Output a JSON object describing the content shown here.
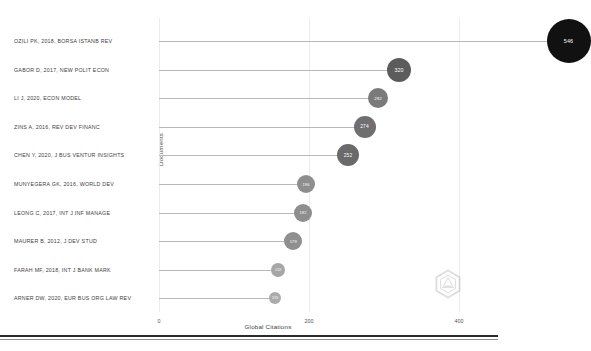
{
  "chart_data": {
    "type": "bar",
    "variant": "lollipop-bubble",
    "title": "",
    "xlabel": "Global Citations",
    "ylabel": "Documents",
    "xlim": [
      0,
      440
    ],
    "xticks": [
      0,
      200,
      400
    ],
    "xtick_labels": [
      "0",
      "200",
      "400"
    ],
    "grid": true,
    "grid_axis": "x",
    "legend": false,
    "categories": [
      "OZILI PK, 2018, BORSA ISTANB REV",
      "GABOR D, 2017, NEW POLIT ECON",
      "LI J, 2020, ECON MODEL",
      "ZINS A, 2016, REV DEV FINANC",
      "CHEN Y, 2020, J BUS VENTUR INSIGHTS",
      "MUNYEGERA GK, 2016, WORLD DEV",
      "LEONG C, 2017, INT J INF MANAGE",
      "MAURER B, 2012, J DEV STUD",
      "FARAH MF, 2018, INT J BANK MARK",
      "ARNER DW, 2020, EUR BUS ORG LAW REV"
    ],
    "values": [
      546,
      320,
      292,
      274,
      252,
      196,
      192,
      179,
      159,
      155
    ],
    "point_labels": [
      "546",
      "320",
      "292",
      "274",
      "252",
      "196",
      "192",
      "179",
      "159",
      "155"
    ],
    "point_sizes": [
      22,
      12,
      10,
      11,
      11,
      9,
      9,
      9,
      7,
      6
    ],
    "point_colors": [
      "#111111",
      "#5c5c5c",
      "#7a7a7a",
      "#6f6f6f",
      "#6a6a6a",
      "#8e8e8e",
      "#8e8e8e",
      "#8f8f8f",
      "#a6a6a6",
      "#ababab"
    ],
    "stem_color": "#b9b9b9"
  },
  "watermark": {
    "name": "hexagon-logo-watermark"
  }
}
